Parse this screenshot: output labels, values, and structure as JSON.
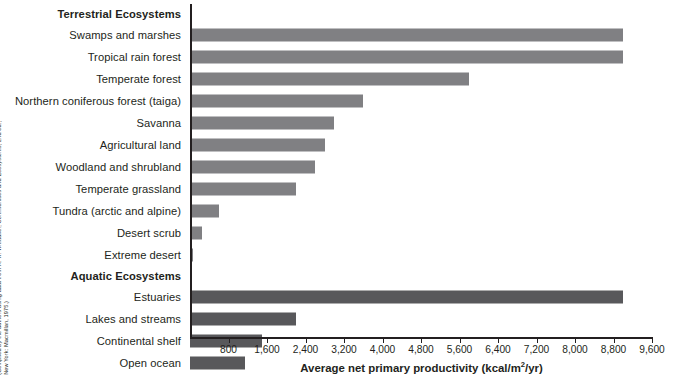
{
  "credit": {
    "line1": "(Compiled by the authors using data from R. H. Whittaker, Communities and Ecosystems, 2nd ed.,",
    "line2": "New York: Macmillan, 1975.)"
  },
  "axis": {
    "title_main": "Average net primary productivity (kcal/m",
    "title_sup": "2",
    "title_tail": "/yr)",
    "tick_labels": [
      "800",
      "1,600",
      "2,400",
      "3,200",
      "4,000",
      "4,800",
      "5,600",
      "6,400",
      "7,200",
      "8,000",
      "8,800",
      "9,600"
    ]
  },
  "groups": {
    "terrestrial": "Terrestrial Ecosystems",
    "aquatic": "Aquatic Ecosystems"
  },
  "colors": {
    "terrestrial_bar": "#808083",
    "aquatic_bar": "#58585b",
    "axis": "#231f20",
    "background": "#ffffff"
  },
  "chart_data": {
    "type": "bar",
    "orientation": "horizontal",
    "title": "",
    "xlabel": "Average net primary productivity (kcal/m2/yr)",
    "ylabel": "",
    "xlim": [
      0,
      9600
    ],
    "xticks": [
      800,
      1600,
      2400,
      3200,
      4000,
      4800,
      5600,
      6400,
      7200,
      8000,
      8800,
      9600
    ],
    "grid": false,
    "legend": "none",
    "groups": [
      {
        "name": "Terrestrial Ecosystems",
        "color": "#808083",
        "categories": [
          "Swamps and marshes",
          "Tropical rain forest",
          "Temperate forest",
          "Northern coniferous forest (taiga)",
          "Savanna",
          "Agricultural land",
          "Woodland and shrubland",
          "Temperate grassland",
          "Tundra (arctic and alpine)",
          "Desert scrub",
          "Extreme desert"
        ],
        "values": [
          9000,
          9000,
          5800,
          3600,
          3000,
          2800,
          2600,
          2200,
          600,
          250,
          70
        ]
      },
      {
        "name": "Aquatic Ecosystems",
        "color": "#58585b",
        "categories": [
          "Estuaries",
          "Lakes and streams",
          "Continental shelf",
          "Open ocean"
        ],
        "values": [
          9000,
          2200,
          1500,
          1150
        ]
      }
    ]
  }
}
